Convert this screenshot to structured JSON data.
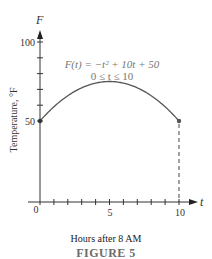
{
  "chart_data": {
    "type": "line",
    "title": "",
    "function_label": "F(t) = −t² + 10t + 50",
    "domain_label": "0 ≤ t ≤ 10",
    "xlabel": "Hours after 8 AM",
    "ylabel": "Temperature, °F",
    "x_axis_var": "t",
    "y_axis_var": "F",
    "xlim": [
      0,
      10
    ],
    "ylim": [
      0,
      100
    ],
    "x_ticks": [
      0,
      1,
      2,
      3,
      4,
      5,
      6,
      7,
      8,
      9,
      10
    ],
    "x_tick_labels": {
      "0": "0",
      "5": "5",
      "10": "10"
    },
    "y_ticks": [
      50,
      60,
      70,
      80,
      90,
      100
    ],
    "y_tick_labels": {
      "50": "50",
      "100": "100"
    },
    "grid": false,
    "legend": null,
    "series": [
      {
        "name": "F(t) = −t² + 10t + 50",
        "x": [
          0,
          1,
          2,
          3,
          4,
          5,
          6,
          7,
          8,
          9,
          10
        ],
        "values": [
          50,
          59,
          66,
          71,
          74,
          75,
          74,
          71,
          66,
          59,
          50
        ]
      }
    ],
    "annotations": [
      {
        "type": "endpoint",
        "t": 0,
        "F": 50
      },
      {
        "type": "endpoint",
        "t": 10,
        "F": 50
      },
      {
        "type": "dashed-vertical",
        "t": 10,
        "from": 0,
        "to": 50
      }
    ],
    "caption": "FIGURE 5"
  },
  "labels": {
    "y_var": "F",
    "x_var": "t",
    "y_tick_100": "100",
    "y_tick_50": "50",
    "x_tick_0": "0",
    "x_tick_5": "5",
    "x_tick_10": "10",
    "equation": "F(t) = −t² + 10t + 50",
    "domain": "0 ≤ t ≤ 10",
    "xlabel": "Hours after 8 AM",
    "ylabel": "Temperature, °F",
    "caption": "FIGURE 5"
  }
}
